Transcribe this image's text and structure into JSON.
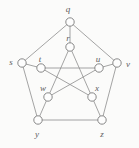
{
  "figure": {
    "kind": "graph-drawing",
    "name": "Petersen graph",
    "width": 139,
    "height": 148,
    "background_color": "#fbfbfa",
    "edge_color": "#8d8d8d",
    "node_stroke_color": "#7b7b7b",
    "node_fill_color": "#fdfdfd",
    "label_color": "#5d5d5d",
    "node_radius": 4.2
  },
  "chart_data": {
    "type": "diagram",
    "title": "",
    "nodes": [
      {
        "id": "q",
        "label": "q",
        "cx": 70,
        "cy": 22,
        "label_x": 68,
        "label_y": 9,
        "ring": "outer"
      },
      {
        "id": "v",
        "label": "v",
        "cx": 117,
        "cy": 63,
        "label_x": 128,
        "label_y": 64,
        "ring": "outer"
      },
      {
        "id": "z",
        "label": "z",
        "cx": 102,
        "cy": 120,
        "label_x": 102,
        "label_y": 134,
        "ring": "outer"
      },
      {
        "id": "y",
        "label": "y",
        "cx": 38,
        "cy": 120,
        "label_x": 37,
        "label_y": 134,
        "ring": "outer"
      },
      {
        "id": "s",
        "label": "s",
        "cx": 22,
        "cy": 63,
        "label_x": 11,
        "label_y": 62,
        "ring": "outer"
      },
      {
        "id": "r",
        "label": "r",
        "cx": 70,
        "cy": 47,
        "label_x": 68,
        "label_y": 38,
        "ring": "inner"
      },
      {
        "id": "u",
        "label": "u",
        "cx": 99,
        "cy": 68,
        "label_x": 98,
        "label_y": 59,
        "ring": "inner"
      },
      {
        "id": "x",
        "label": "x",
        "cx": 92,
        "cy": 97,
        "label_x": 97,
        "label_y": 88,
        "ring": "inner"
      },
      {
        "id": "w",
        "label": "w",
        "cx": 48,
        "cy": 97,
        "label_x": 43,
        "label_y": 88,
        "ring": "inner"
      },
      {
        "id": "t",
        "label": "t",
        "cx": 41,
        "cy": 68,
        "label_x": 40,
        "label_y": 59,
        "ring": "inner"
      }
    ],
    "edges": [
      {
        "from": "q",
        "to": "v",
        "kind": "outer-cycle"
      },
      {
        "from": "v",
        "to": "z",
        "kind": "outer-cycle"
      },
      {
        "from": "z",
        "to": "y",
        "kind": "outer-cycle"
      },
      {
        "from": "y",
        "to": "s",
        "kind": "outer-cycle"
      },
      {
        "from": "s",
        "to": "q",
        "kind": "outer-cycle"
      },
      {
        "from": "q",
        "to": "r",
        "kind": "spoke"
      },
      {
        "from": "v",
        "to": "u",
        "kind": "spoke"
      },
      {
        "from": "z",
        "to": "x",
        "kind": "spoke"
      },
      {
        "from": "y",
        "to": "w",
        "kind": "spoke"
      },
      {
        "from": "s",
        "to": "t",
        "kind": "spoke"
      },
      {
        "from": "r",
        "to": "w",
        "kind": "inner-pentagram"
      },
      {
        "from": "r",
        "to": "x",
        "kind": "inner-pentagram"
      },
      {
        "from": "u",
        "to": "w",
        "kind": "inner-pentagram"
      },
      {
        "from": "u",
        "to": "t",
        "kind": "inner-pentagram"
      },
      {
        "from": "x",
        "to": "t",
        "kind": "inner-pentagram"
      }
    ]
  }
}
